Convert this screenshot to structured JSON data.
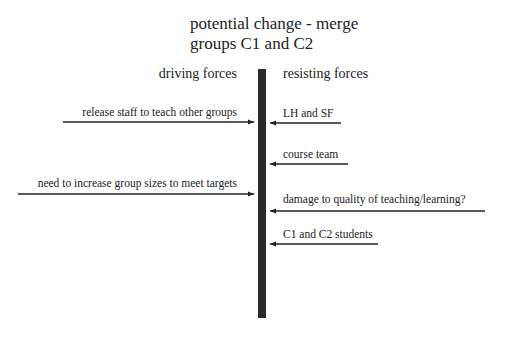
{
  "title": {
    "line1": "potential change - merge",
    "line2": "groups C1 and C2"
  },
  "headers": {
    "driving": "driving forces",
    "resisting": "resisting forces"
  },
  "driving_forces": [
    {
      "label": "release staff to teach other groups"
    },
    {
      "label": "need to increase group sizes to meet targets"
    }
  ],
  "resisting_forces": [
    {
      "label": "LH and SF"
    },
    {
      "label": "course team"
    },
    {
      "label": "damage to quality of teaching/learning?"
    },
    {
      "label": "C1 and C2 students"
    }
  ],
  "colors": {
    "bar": "#2a2a2a",
    "arrow": "#222222",
    "text": "#222222"
  }
}
